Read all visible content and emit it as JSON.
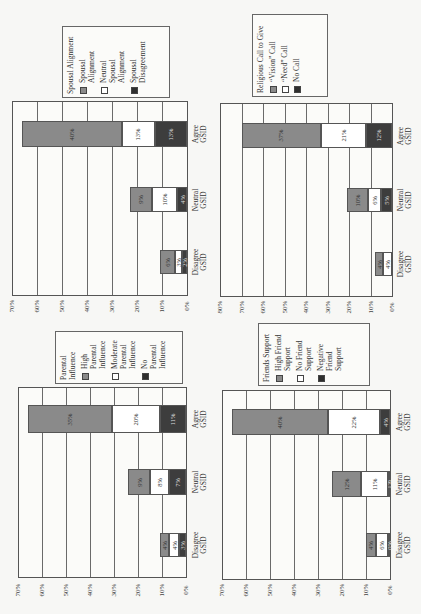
{
  "page": {
    "orientation": "rotated 90 degrees counterclockwise (landscape figure on portrait scan)"
  },
  "chart_data": [
    {
      "id": "spousal",
      "type": "bar",
      "orientation": "horizontal stacked (rotated)",
      "title": "Spousal Alignment",
      "categories": [
        "Disagree GSID",
        "Neutral GSID",
        "Agree GSID"
      ],
      "series": [
        {
          "name": "Spousal Alignment",
          "values": [
            6,
            9,
            40
          ],
          "labels": [
            "6%",
            "9%",
            "40%"
          ]
        },
        {
          "name": "Neutral Spousal Alignment",
          "values": [
            3,
            10,
            13
          ],
          "labels": [
            "3%",
            "10%",
            "13%"
          ]
        },
        {
          "name": "Spousal Disagreement",
          "values": [
            2,
            4,
            13
          ],
          "labels": [
            "2%",
            "4%",
            "13%"
          ]
        }
      ],
      "legend_title": "Spousal Alignment",
      "legend_lines": [
        [
          "Spousal",
          "Alignment"
        ],
        [
          "Neutral",
          "Spousal",
          "Alignment"
        ],
        [
          "Spousal",
          "Disagreement"
        ]
      ],
      "ticks": [
        "70%",
        "60%",
        "50%",
        "40%",
        "30%",
        "20%",
        "10%",
        "0%"
      ],
      "ylim": [
        0,
        70
      ],
      "grid": true
    },
    {
      "id": "religious",
      "type": "bar",
      "orientation": "horizontal stacked (rotated)",
      "title": "Religious Call to Give",
      "categories": [
        "Disagree GSID",
        "Neutral GSID",
        "Agree GSID"
      ],
      "series": [
        {
          "name": "\"Vision\" Call",
          "values": [
            4,
            10,
            37
          ],
          "labels": [
            "4%",
            "10%",
            "37%"
          ]
        },
        {
          "name": "\"Need\" Call",
          "values": [
            4,
            6,
            21
          ],
          "labels": [
            "4%",
            "6%",
            "21%"
          ]
        },
        {
          "name": "No Call",
          "values": [
            0,
            5,
            12
          ],
          "labels": [
            "",
            "5%",
            "12%"
          ]
        }
      ],
      "legend_title": "Religious Call to Give",
      "legend_lines": [
        [
          "“Vision” Call"
        ],
        [
          "“Need” Call"
        ],
        [
          "No Call"
        ]
      ],
      "ticks": [
        "80%",
        "70%",
        "60%",
        "50%",
        "40%",
        "30%",
        "20%",
        "10%",
        "0%"
      ],
      "ylim": [
        0,
        80
      ],
      "grid": true
    },
    {
      "id": "parental",
      "type": "bar",
      "orientation": "horizontal stacked (rotated)",
      "title": "Parental Influence",
      "categories": [
        "Disagree GSID",
        "Neutral GSID",
        "Agree GSID"
      ],
      "series": [
        {
          "name": "High Parental Influence",
          "values": [
            4,
            9,
            35
          ],
          "labels": [
            "4%",
            "9%",
            "35%"
          ]
        },
        {
          "name": "Moderate Parental Influence",
          "values": [
            4,
            8,
            20
          ],
          "labels": [
            "4%",
            "8%",
            "20%"
          ]
        },
        {
          "name": "No Parental Influence",
          "values": [
            3,
            7,
            11
          ],
          "labels": [
            "3%",
            "7%",
            "11%"
          ]
        }
      ],
      "legend_title": "Parental Influence",
      "legend_lines": [
        [
          "High",
          "Parental",
          "Influence"
        ],
        [
          "Moderate",
          "Parental",
          "Influence"
        ],
        [
          "No",
          "Parental",
          "Influence"
        ]
      ],
      "ticks": [
        "70%",
        "60%",
        "50%",
        "40%",
        "30%",
        "20%",
        "10%",
        "0%"
      ],
      "ylim": [
        0,
        70
      ],
      "grid": true
    },
    {
      "id": "friends",
      "type": "bar",
      "orientation": "horizontal stacked (rotated)",
      "title": "Friends Support",
      "categories": [
        "Disagree GSID",
        "Neutral GSID",
        "Agree GSID"
      ],
      "series": [
        {
          "name": "High Friend Support",
          "values": [
            4,
            12,
            40
          ],
          "labels": [
            "4%",
            "12%",
            "40%"
          ]
        },
        {
          "name": "No Friend Support",
          "values": [
            6,
            11,
            22
          ],
          "labels": [
            "6%",
            "11%",
            "22%"
          ]
        },
        {
          "name": "Negative Friend Support",
          "values": [
            0,
            1,
            4
          ],
          "labels": [
            "0%",
            "1%",
            "4%"
          ]
        }
      ],
      "legend_title": "Friends Support",
      "legend_lines": [
        [
          "High Friend",
          "Support"
        ],
        [
          "No Friend",
          "Support"
        ],
        [
          "Negative",
          "Friend",
          "Support"
        ]
      ],
      "ticks": [
        "70%",
        "60%",
        "50%",
        "40%",
        "30%",
        "20%",
        "10%",
        "0%"
      ],
      "ylim": [
        0,
        70
      ],
      "grid": true
    }
  ],
  "layout": {
    "panels": [
      {
        "plot": {
          "left": 12,
          "right": 187,
          "top": 101,
          "bottom": 296
        },
        "bars_y": [
          [
            250,
            274
          ],
          [
            187,
            212
          ],
          [
            121,
            147
          ]
        ],
        "legend": {
          "left": 62,
          "top": 26,
          "width": 108,
          "height": 72
        },
        "tick_y": 306,
        "cat_x": 200
      },
      {
        "plot": {
          "left": 220,
          "right": 392,
          "top": 103,
          "bottom": 297
        },
        "bars_y": [
          [
            252,
            276
          ],
          [
            188,
            212
          ],
          [
            123,
            148
          ]
        ],
        "legend": {
          "left": 252,
          "top": 14,
          "width": 76,
          "height": 83
        },
        "tick_y": 307,
        "cat_x": 405
      },
      {
        "plot": {
          "left": 18,
          "right": 186,
          "top": 387,
          "bottom": 578
        },
        "bars_y": [
          [
            533,
            557
          ],
          [
            469,
            495
          ],
          [
            405,
            433
          ]
        ],
        "legend": {
          "left": 55,
          "top": 331,
          "width": 128,
          "height": 53
        },
        "tick_y": 590,
        "cat_x": 200
      },
      {
        "plot": {
          "left": 222,
          "right": 390,
          "top": 390,
          "bottom": 580
        },
        "bars_y": [
          [
            533,
            557
          ],
          [
            471,
            497
          ],
          [
            409,
            435
          ]
        ],
        "legend": {
          "left": 258,
          "top": 323,
          "width": 112,
          "height": 63
        },
        "tick_y": 590,
        "cat_x": 404
      }
    ]
  }
}
